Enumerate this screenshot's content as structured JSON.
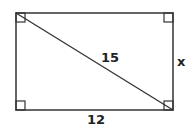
{
  "diagram": {
    "shape": "rectangle",
    "stroke_color": "#333333",
    "labels": {
      "diagonal": "15",
      "bottom": "12",
      "right": "x"
    },
    "right_angle_marks": [
      "top-left",
      "top-right",
      "bottom-left",
      "bottom-right"
    ]
  }
}
